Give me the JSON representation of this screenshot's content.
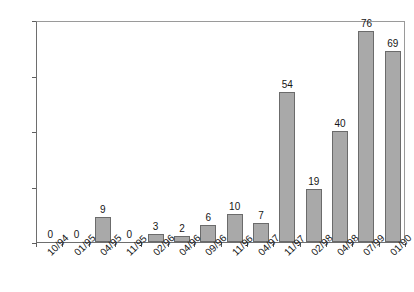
{
  "chart_data": {
    "type": "bar",
    "title": "",
    "subtitle": "",
    "xlabel": "",
    "ylabel": "",
    "ylim": [
      0,
      80
    ],
    "yticks": [
      0,
      20,
      40,
      60,
      80
    ],
    "grid": false,
    "legend": false,
    "bar_color": "#a9a9a9",
    "bar_border_color": "#6b6b6b",
    "axis_color": "#6e6e6e",
    "text_color": "#161616",
    "show_data_labels": true,
    "categories": [
      "10/94",
      "01/95",
      "04/95",
      "11/95",
      "02/96",
      "04/96",
      "09/96",
      "11/96",
      "04/97",
      "11/97",
      "02/98",
      "04/98",
      "07/99",
      "01/00"
    ],
    "values": [
      0,
      0,
      9,
      0,
      3,
      2,
      6,
      10,
      7,
      54,
      19,
      40,
      76,
      69
    ]
  }
}
